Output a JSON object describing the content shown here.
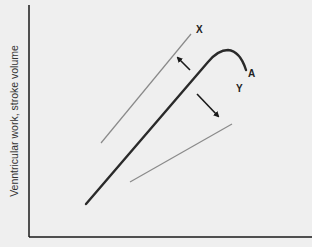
{
  "diagram": {
    "type": "frank-starling-curve",
    "y_axis_label": "Venntricular work, stroke volume",
    "x_axis_label": "",
    "labels": {
      "x": "X",
      "a": "A",
      "y": "Y"
    },
    "elements": [
      {
        "id": "curve-A",
        "description": "Main ventricular function curve rising then turning down",
        "color": "#2a2a2a"
      },
      {
        "id": "line-X",
        "description": "Shifted curve up-left (increased contractility)",
        "color": "#888888"
      },
      {
        "id": "line-Y",
        "description": "Shifted curve down-right (decreased contractility)",
        "color": "#888888"
      },
      {
        "id": "arrow-toward-X",
        "description": "Arrow pointing up-left toward X"
      },
      {
        "id": "arrow-toward-Y",
        "description": "Arrow pointing down-right toward Y"
      }
    ],
    "colors": {
      "background": "#efefef",
      "axis": "#1a1a1a",
      "main_curve": "#2a2a2a",
      "shift_lines": "#888888"
    }
  }
}
